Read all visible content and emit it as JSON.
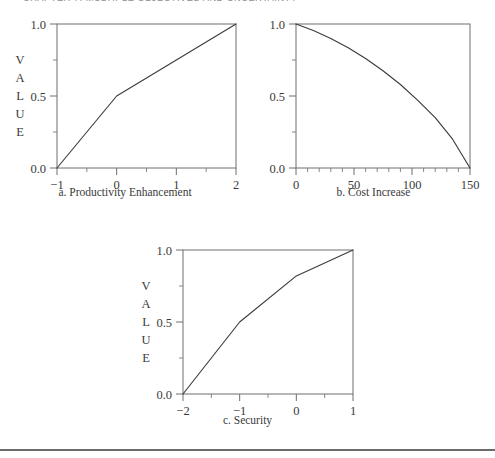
{
  "header": {
    "running_title": "CHAPTER 7.  MULTIPLE OBJECTIVES AND UNCERTAINTY"
  },
  "figure": {
    "captions": {
      "a": "a.  Productivity Enhancement",
      "b": "b.  Cost Increase",
      "c": "c.  Security"
    },
    "axis_title": "VALUE",
    "axis_title_letters": [
      "V",
      "A",
      "L",
      "U",
      "E"
    ]
  },
  "chart_data": [
    {
      "id": "a",
      "type": "line",
      "title": "a.  Productivity Enhancement",
      "xlabel": "",
      "ylabel": "VALUE",
      "xlim": [
        -1,
        2
      ],
      "ylim": [
        0.0,
        1.0
      ],
      "grid": false,
      "legend": "none",
      "x_ticks": [
        -1,
        0,
        1,
        2
      ],
      "x_tick_labels": [
        "−1",
        "0",
        "1",
        "2"
      ],
      "y_ticks": [
        0.0,
        0.5,
        1.0
      ],
      "y_tick_labels": [
        "0.0",
        "0.5",
        "1.0"
      ],
      "y_minor_ticks": [
        0.25,
        0.75
      ],
      "x_minor_ticks": [
        -0.5,
        0.5,
        1.5
      ],
      "x": [
        -1,
        0,
        2
      ],
      "y": [
        0.0,
        0.5,
        1.0
      ],
      "shape": "piecewise-linear, concave"
    },
    {
      "id": "b",
      "type": "line",
      "title": "b.  Cost Increase",
      "xlabel": "",
      "ylabel": "",
      "xlim": [
        0,
        150
      ],
      "ylim": [
        0.0,
        1.0
      ],
      "grid": false,
      "legend": "none",
      "x_ticks": [
        0,
        50,
        100,
        150
      ],
      "x_tick_labels": [
        "0",
        "50",
        "100",
        "150"
      ],
      "y_ticks": [
        0.0,
        0.5,
        1.0
      ],
      "y_tick_labels": [
        "0.0",
        "0.5",
        "1.0"
      ],
      "y_minor_ticks": [
        0.25,
        0.75
      ],
      "x_minor_ticks": [
        10,
        20,
        30,
        40,
        60,
        70,
        80,
        90,
        110,
        120,
        130,
        140
      ],
      "x": [
        0,
        15,
        30,
        45,
        60,
        75,
        90,
        105,
        120,
        135,
        150
      ],
      "y": [
        1.0,
        0.955,
        0.9,
        0.835,
        0.76,
        0.675,
        0.58,
        0.47,
        0.35,
        0.2,
        0.0
      ],
      "shape": "smooth decreasing, concave"
    },
    {
      "id": "c",
      "type": "line",
      "title": "c.  Security",
      "xlabel": "",
      "ylabel": "VALUE",
      "xlim": [
        -2,
        1
      ],
      "ylim": [
        0.0,
        1.0
      ],
      "grid": false,
      "legend": "none",
      "x_ticks": [
        -2,
        -1,
        0,
        1
      ],
      "x_tick_labels": [
        "−2",
        "−1",
        "0",
        "1"
      ],
      "y_ticks": [
        0.0,
        0.5,
        1.0
      ],
      "y_tick_labels": [
        "0.0",
        "0.5",
        "1.0"
      ],
      "y_minor_ticks": [
        0.25,
        0.75
      ],
      "x_minor_ticks": [
        -1.5,
        -0.5,
        0.5
      ],
      "x": [
        -2,
        -1,
        0,
        1
      ],
      "y": [
        0.0,
        0.5,
        0.82,
        1.0
      ],
      "shape": "piecewise-linear, concave"
    }
  ]
}
